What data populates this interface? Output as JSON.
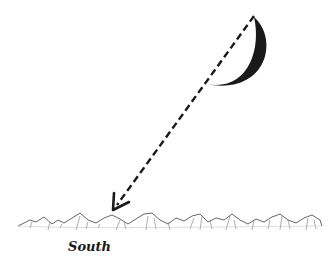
{
  "diagram": {
    "direction_label": "South",
    "elements": [
      "crescent-moon",
      "dashed-arrow",
      "mountain-range"
    ],
    "colors": {
      "ink": "#1a1a1a",
      "background": "#ffffff"
    }
  }
}
